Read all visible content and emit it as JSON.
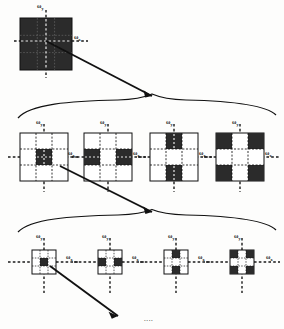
{
  "figure": {
    "title_visible": false,
    "colors": {
      "ink": "#111111",
      "fill_dark": "#2b2b2b",
      "fill_light": "#ffffff",
      "axis": "#1a1a1a",
      "background": "#fdfdfc"
    },
    "axis_labels": {
      "x": "ω",
      "x_sub": "x",
      "y": "ω",
      "y_sub": "y"
    },
    "ellipsis": "....",
    "levels": [
      {
        "name": "level-1",
        "count": 1,
        "blocks": [
          {
            "id": "l1-b1",
            "pattern": "all-filled",
            "grid": [
              [
                1,
                1,
                1
              ],
              [
                1,
                1,
                1
              ],
              [
                1,
                1,
                1
              ]
            ],
            "x_label": "ω",
            "x_sub": "x",
            "y_label": "ω",
            "y_sub": "y"
          }
        ]
      },
      {
        "name": "level-2",
        "count": 4,
        "blocks": [
          {
            "id": "l2-b1",
            "pattern": "center",
            "grid": [
              [
                0,
                0,
                0
              ],
              [
                0,
                1,
                0
              ],
              [
                0,
                0,
                0
              ]
            ],
            "x_label": "ω",
            "x_sub": "x",
            "y_label": "ω",
            "y_sub": "y"
          },
          {
            "id": "l2-b2",
            "pattern": "left-right",
            "grid": [
              [
                0,
                0,
                0
              ],
              [
                1,
                0,
                1
              ],
              [
                0,
                0,
                0
              ]
            ],
            "x_label": "ω",
            "x_sub": "x",
            "y_label": "ω",
            "y_sub": "y"
          },
          {
            "id": "l2-b3",
            "pattern": "top-bottom",
            "grid": [
              [
                0,
                1,
                0
              ],
              [
                0,
                0,
                0
              ],
              [
                0,
                1,
                0
              ]
            ],
            "x_label": "ω",
            "x_sub": "x",
            "y_label": "ω",
            "y_sub": "y"
          },
          {
            "id": "l2-b4",
            "pattern": "corners",
            "grid": [
              [
                1,
                0,
                1
              ],
              [
                0,
                0,
                0
              ],
              [
                1,
                0,
                1
              ]
            ],
            "x_label": "ω",
            "x_sub": "x",
            "y_label": "ω",
            "y_sub": "y"
          }
        ]
      },
      {
        "name": "level-3",
        "count": 4,
        "blocks": [
          {
            "id": "l3-b1",
            "pattern": "center",
            "grid": [
              [
                0,
                0,
                0
              ],
              [
                0,
                1,
                0
              ],
              [
                0,
                0,
                0
              ]
            ],
            "x_label": "ω",
            "x_sub": "x",
            "y_label": "ω",
            "y_sub": "y"
          },
          {
            "id": "l3-b2",
            "pattern": "left-right",
            "grid": [
              [
                0,
                0,
                0
              ],
              [
                1,
                0,
                1
              ],
              [
                0,
                0,
                0
              ]
            ],
            "x_label": "ω",
            "x_sub": "x",
            "y_label": "ω",
            "y_sub": "y"
          },
          {
            "id": "l3-b3",
            "pattern": "top-bottom",
            "grid": [
              [
                0,
                1,
                0
              ],
              [
                0,
                0,
                0
              ],
              [
                0,
                1,
                0
              ]
            ],
            "x_label": "ω",
            "x_sub": "x",
            "y_label": "ω",
            "y_sub": "y"
          },
          {
            "id": "l3-b4",
            "pattern": "corners",
            "grid": [
              [
                1,
                0,
                1
              ],
              [
                0,
                0,
                0
              ],
              [
                1,
                0,
                1
              ]
            ],
            "x_label": "ω",
            "x_sub": "x",
            "y_label": "ω",
            "y_sub": "y"
          }
        ]
      }
    ],
    "connectors": [
      {
        "name": "arrow-level1-to-level2",
        "type": "arrow"
      },
      {
        "name": "brace-level2",
        "type": "brace"
      },
      {
        "name": "arrow-level2-to-level3",
        "type": "arrow"
      },
      {
        "name": "brace-level3",
        "type": "brace"
      },
      {
        "name": "arrow-level3-to-next",
        "type": "arrow"
      }
    ]
  }
}
